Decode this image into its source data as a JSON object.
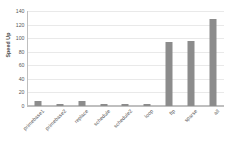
{
  "chart_data": {
    "type": "bar",
    "title": "",
    "xlabel": "",
    "ylabel": "Speed Up",
    "ylim": [
      0,
      140
    ],
    "ytick_values": [
      0,
      20,
      40,
      60,
      80,
      100,
      120,
      140
    ],
    "ytick_labels": [
      "0",
      "20",
      "40",
      "60",
      "80",
      "100",
      "120",
      "140"
    ],
    "grid": true,
    "legend": "none",
    "bar_color": "#8c8c8c",
    "grid_color": "#e9e9e9",
    "axis_color": "#bfbfbf",
    "text_color": "#595959",
    "categories": [
      "primebase1",
      "primebase2",
      "replace",
      "schedule",
      "schedule2",
      "loop",
      "ftp",
      "sparse",
      "all"
    ],
    "values": [
      7,
      3,
      7,
      3,
      3,
      2,
      95,
      96,
      128
    ]
  }
}
